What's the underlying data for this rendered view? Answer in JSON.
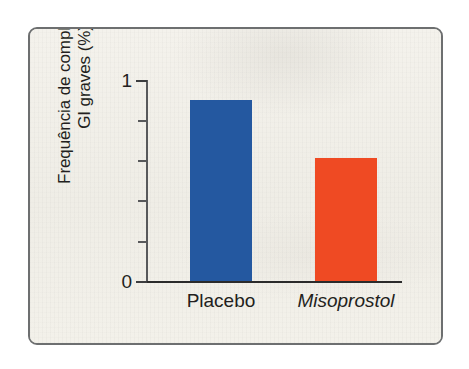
{
  "figure": {
    "frame_border_color": "#6d6f70",
    "paper_color": "#f2f0ea"
  },
  "chart_data": {
    "type": "bar",
    "title": "",
    "subtitle": "",
    "xlabel": "",
    "ylabel": "Frequência de complicações GI graves (%)",
    "ylabel_line1": "Frequência de complicações",
    "ylabel_line2": "GI graves (%)",
    "categories": [
      "Placebo",
      "Misoprostol"
    ],
    "values": [
      0.9,
      0.61
    ],
    "series": [
      {
        "name": "Frequência de complicações GI graves (%)",
        "values": [
          0.9,
          0.61
        ]
      }
    ],
    "bar_colors": [
      "#2458a0",
      "#ef4a23"
    ],
    "category_styles": [
      "normal",
      "italic"
    ],
    "ylim": [
      0,
      1
    ],
    "y_tick_values": [
      0,
      0.2,
      0.4,
      0.6,
      0.8,
      1
    ],
    "y_tick_labels": [
      "0",
      "",
      "",
      "",
      "",
      "1"
    ],
    "y_labeled_ticks": [
      "1",
      "0"
    ],
    "grid": false,
    "legend": false,
    "legend_position": "none",
    "annotations": []
  },
  "axis": {
    "y_top_label": "1",
    "y_bottom_label": "0"
  }
}
